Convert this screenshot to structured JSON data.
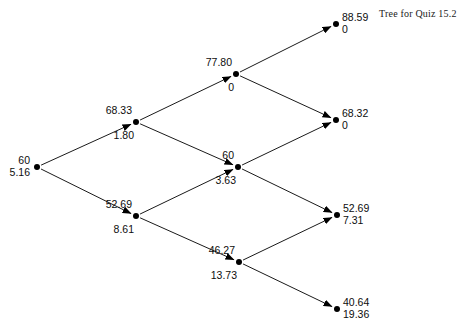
{
  "title": {
    "text": "Tree for Quiz 15.2",
    "x": 379,
    "y": 8
  },
  "canvas": {
    "width": 468,
    "height": 335,
    "background": "#ffffff",
    "stroke": "#000000",
    "node_fill": "#000000"
  },
  "chart_data": {
    "type": "diagram",
    "diagram_type": "binomial-tree",
    "title": "Tree for Quiz 15.2",
    "steps": 3,
    "node_value_labels": [
      "asset price",
      "option value"
    ],
    "nodes": [
      {
        "id": "n0",
        "step": 0,
        "level": 0,
        "asset_price": "60",
        "option_value": "5.16",
        "x": 37,
        "y": 167,
        "label_side": "left"
      },
      {
        "id": "n1u",
        "step": 1,
        "level": 1,
        "asset_price": "68.33",
        "option_value": "1.80",
        "x": 136,
        "y": 122,
        "label_side": "split"
      },
      {
        "id": "n1d",
        "step": 1,
        "level": -1,
        "asset_price": "52.69",
        "option_value": "8.61",
        "x": 136,
        "y": 216,
        "label_side": "split"
      },
      {
        "id": "n2uu",
        "step": 2,
        "level": 2,
        "asset_price": "77.80",
        "option_value": "0",
        "x": 236,
        "y": 74,
        "label_side": "split"
      },
      {
        "id": "n2ud",
        "step": 2,
        "level": 0,
        "asset_price": "60",
        "option_value": "3.63",
        "x": 238,
        "y": 167,
        "label_side": "split"
      },
      {
        "id": "n2dd",
        "step": 2,
        "level": -2,
        "asset_price": "46.27",
        "option_value": "13.73",
        "x": 239,
        "y": 262,
        "label_side": "split"
      },
      {
        "id": "n3uuu",
        "step": 3,
        "level": 3,
        "asset_price": "88.59",
        "option_value": "0",
        "x": 336,
        "y": 24,
        "label_side": "right"
      },
      {
        "id": "n3uud",
        "step": 3,
        "level": 1,
        "asset_price": "68.32",
        "option_value": "0",
        "x": 336,
        "y": 120,
        "label_side": "right"
      },
      {
        "id": "n3udd",
        "step": 3,
        "level": -1,
        "asset_price": "52.69",
        "option_value": "7.31",
        "x": 337,
        "y": 215,
        "label_side": "right"
      },
      {
        "id": "n3ddd",
        "step": 3,
        "level": -3,
        "asset_price": "40.64",
        "option_value": "19.36",
        "x": 337,
        "y": 309,
        "label_side": "right"
      }
    ],
    "edges": [
      {
        "from": "n0",
        "to": "n1u",
        "direction": "up"
      },
      {
        "from": "n0",
        "to": "n1d",
        "direction": "down"
      },
      {
        "from": "n1u",
        "to": "n2uu",
        "direction": "up"
      },
      {
        "from": "n1u",
        "to": "n2ud",
        "direction": "down"
      },
      {
        "from": "n1d",
        "to": "n2ud",
        "direction": "up"
      },
      {
        "from": "n1d",
        "to": "n2dd",
        "direction": "down"
      },
      {
        "from": "n2uu",
        "to": "n3uuu",
        "direction": "up"
      },
      {
        "from": "n2uu",
        "to": "n3uud",
        "direction": "down"
      },
      {
        "from": "n2ud",
        "to": "n3uud",
        "direction": "up"
      },
      {
        "from": "n2ud",
        "to": "n3udd",
        "direction": "down"
      },
      {
        "from": "n2dd",
        "to": "n3udd",
        "direction": "up"
      },
      {
        "from": "n2dd",
        "to": "n3ddd",
        "direction": "down"
      }
    ]
  }
}
